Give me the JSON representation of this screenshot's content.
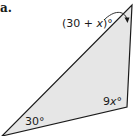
{
  "problem": {
    "part_label": "a."
  },
  "triangle": {
    "fill_color": "#e6e6e6",
    "stroke_color": "#1a1a1a",
    "vertices": {
      "top": [
        132,
        5
      ],
      "bottom_right": [
        127,
        107
      ],
      "bottom_left": [
        2,
        136
      ]
    },
    "angles": {
      "top": {
        "prefix": "(30 + ",
        "var": "x",
        "suffix": ")°"
      },
      "bottom_right": {
        "prefix": "9",
        "var": "x",
        "suffix": "°"
      },
      "bottom_left": {
        "prefix": "30°",
        "var": "",
        "suffix": ""
      }
    }
  }
}
